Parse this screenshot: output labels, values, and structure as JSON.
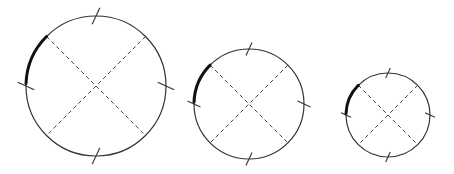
{
  "diagram": {
    "colors": {
      "background": "#ffffff",
      "stroke": "#333333",
      "dash": "#444444",
      "arc": "#111111"
    },
    "style": {
      "circle_width": 1.2,
      "dash_width": 1,
      "dash_pattern": "4 3",
      "tick_width": 1.1,
      "arc_width": 3,
      "tick_half_length_ratio": 0.13,
      "tick_tilt_deg": 25,
      "diagonal_angles_deg": [
        -45,
        -135,
        45,
        135
      ],
      "tick_angles_deg": [
        -90,
        0,
        90,
        180
      ],
      "arc_start_deg": -135,
      "arc_end_deg": -178
    },
    "circles": [
      {
        "name": "large",
        "cx": 96,
        "cy": 86,
        "r": 70
      },
      {
        "name": "medium",
        "cx": 249,
        "cy": 104,
        "r": 55
      },
      {
        "name": "small",
        "cx": 388,
        "cy": 115,
        "r": 42
      }
    ]
  }
}
